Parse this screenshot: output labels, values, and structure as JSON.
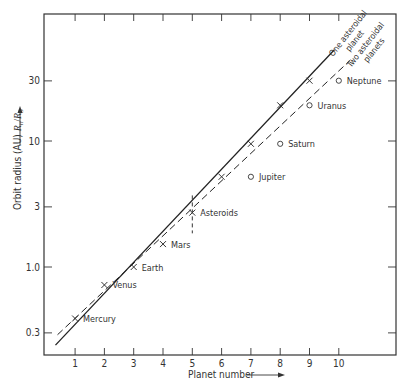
{
  "chart_data": {
    "type": "scatter",
    "title": "",
    "xlabel": "Planet number",
    "ylabel": "Orbit radius (AU) R_n/R_3",
    "ylabel_main": "Orbit radius (AU) ",
    "ylabel_math": "Rn/R3",
    "xlim": [
      0,
      11
    ],
    "ylim": [
      0.22,
      80
    ],
    "yscale": "log",
    "grid": false,
    "x_ticks": [
      1,
      2,
      3,
      4,
      5,
      6,
      7,
      8,
      9,
      10
    ],
    "x_tick_labels": [
      "1",
      "2",
      "3",
      "4",
      "5",
      "6",
      "7",
      "8",
      "9",
      "10"
    ],
    "y_ticks": [
      0.3,
      1.0,
      3,
      10,
      30
    ],
    "y_tick_labels": [
      "0.3",
      "1.0",
      "3",
      "10",
      "30"
    ],
    "series": [
      {
        "name": "One asteroidal planet",
        "marker": "x",
        "line": "solid",
        "points": [
          {
            "x": 1,
            "y": 0.39,
            "label": "Mercury"
          },
          {
            "x": 2,
            "y": 0.72,
            "label": "Venus"
          },
          {
            "x": 3,
            "y": 1.0,
            "label": "Earth"
          },
          {
            "x": 4,
            "y": 1.52,
            "label": "Mars"
          },
          {
            "x": 5,
            "y": 2.7,
            "label": "Asteroids"
          },
          {
            "x": 6,
            "y": 5.2,
            "label": ""
          },
          {
            "x": 7,
            "y": 9.5,
            "label": ""
          },
          {
            "x": 8,
            "y": 19.2,
            "label": ""
          },
          {
            "x": 9,
            "y": 30.1,
            "label": ""
          }
        ]
      },
      {
        "name": "Two asteroidal planets",
        "marker": "o",
        "line": "dashed",
        "points": [
          {
            "x": 7,
            "y": 5.2,
            "label": "Jupiter"
          },
          {
            "x": 8,
            "y": 9.5,
            "label": "Saturn"
          },
          {
            "x": 9,
            "y": 19.2,
            "label": "Uranus"
          },
          {
            "x": 10,
            "y": 30.1,
            "label": "Neptune"
          }
        ]
      }
    ],
    "lines": [
      {
        "name": "One asteroidal planet",
        "style": "solid",
        "from": {
          "x": 0.33,
          "y": 0.24
        },
        "to": {
          "x": 9.85,
          "y": 53
        }
      },
      {
        "name": "Two asteroidal planets",
        "style": "dashed",
        "from": {
          "x": 0.4,
          "y": 0.29
        },
        "to": {
          "x": 10.4,
          "y": 44
        }
      }
    ],
    "annotations": [
      {
        "text": "One asteroidal planet",
        "line1": "One asteroidal",
        "line2": "planet"
      },
      {
        "text": "Two asteroidal planets",
        "line1": "Two asteroidal",
        "line2": "planets"
      },
      {
        "text": "Asteroids error bar",
        "x": 5,
        "y_range": [
          1.85,
          3.7
        ]
      }
    ]
  }
}
